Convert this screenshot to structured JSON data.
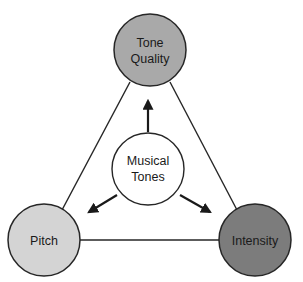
{
  "diagram": {
    "center": {
      "line1": "Musical",
      "line2": "Tones",
      "fill": "#ffffff"
    },
    "nodes": [
      {
        "id": "tone-quality",
        "line1": "Tone",
        "line2": "Quality",
        "fill": "#a9a9a9"
      },
      {
        "id": "pitch",
        "label": "Pitch",
        "fill": "#d4d4d4"
      },
      {
        "id": "intensity",
        "label": "Intensity",
        "fill": "#7c7c7c"
      }
    ],
    "stroke": "#262626"
  }
}
